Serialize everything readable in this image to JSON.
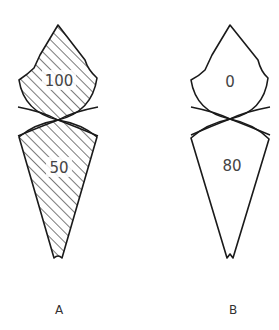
{
  "figure": {
    "panels": [
      {
        "id": "A",
        "caption": "A",
        "shaded": true,
        "upper_value": "100",
        "lower_value": "50"
      },
      {
        "id": "B",
        "caption": "B",
        "shaded": false,
        "upper_value": "0",
        "lower_value": "80"
      }
    ],
    "colors": {
      "stroke": "#1a1a1a",
      "hatch": "#333333",
      "background": "#ffffff"
    }
  }
}
